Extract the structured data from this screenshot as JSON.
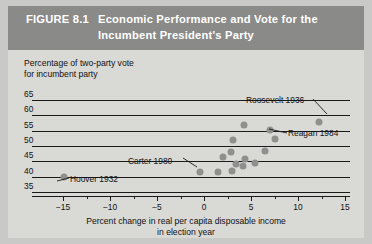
{
  "figure": {
    "number": "FIGURE 8.1",
    "title_line1": "Economic Performance and Vote for the",
    "title_line2": "Incumbent President's Party",
    "banner_color": "#8a8a88",
    "page_background": "#c9c9c7",
    "figure_background": "#d9d9d6"
  },
  "chart_data": {
    "type": "scatter",
    "title": "Economic Performance and Vote for the Incumbent President's Party",
    "xlabel": "Percent change in real per capita disposable income in election year",
    "ylabel": "Percentage of two-party vote for incumbent party",
    "ylabel_line1": "Percentage of two-party vote",
    "ylabel_line2": "for incumbent party",
    "xlabel_line1": "Percent change in real per capita disposable income",
    "xlabel_line2": "in election year",
    "xlim": [
      -15,
      15
    ],
    "ylim": [
      35,
      65
    ],
    "xticks": [
      -15,
      -10,
      -5,
      0,
      5,
      10,
      15
    ],
    "yticks": [
      65,
      60,
      55,
      50,
      45,
      40,
      35
    ],
    "xtick_labels": [
      "−15",
      "−10",
      "−5",
      "0",
      "5",
      "10",
      "15"
    ],
    "ytick_labels": [
      "65",
      "60",
      "55",
      "50",
      "45",
      "40",
      "35"
    ],
    "xtick_minor": [
      -12.5,
      -7.5,
      -2.5,
      2.5,
      7.5,
      12.5
    ],
    "grid": "horizontal",
    "legend": "none",
    "point_color": "#8f8f8d",
    "points": [
      {
        "x": -14.9,
        "y": 39.8,
        "label": "Hoover 1932"
      },
      {
        "x": -0.4,
        "y": 41.4,
        "label": "Carter 1980"
      },
      {
        "x": 1.5,
        "y": 41.6,
        "label": ""
      },
      {
        "x": 3.0,
        "y": 41.9,
        "label": ""
      },
      {
        "x": 3.4,
        "y": 44.2,
        "label": ""
      },
      {
        "x": 4.1,
        "y": 43.6,
        "label": ""
      },
      {
        "x": 2.0,
        "y": 46.3,
        "label": ""
      },
      {
        "x": 2.9,
        "y": 48.1,
        "label": ""
      },
      {
        "x": 4.4,
        "y": 45.9,
        "label": ""
      },
      {
        "x": 5.4,
        "y": 44.5,
        "label": ""
      },
      {
        "x": 6.5,
        "y": 48.3,
        "label": ""
      },
      {
        "x": 3.1,
        "y": 52.0,
        "label": ""
      },
      {
        "x": 7.5,
        "y": 52.4,
        "label": "Reagan 1984"
      },
      {
        "x": 4.3,
        "y": 57.0,
        "label": ""
      },
      {
        "x": 7.0,
        "y": 55.2,
        "label": ""
      },
      {
        "x": 12.2,
        "y": 57.8,
        "label": "Roosevelt 1936"
      }
    ],
    "annotations": [
      {
        "text": "Roosevelt 1936",
        "text_x": 238,
        "text_y": 89,
        "line_x1": 304,
        "line_y1": 92,
        "line_x2": 318,
        "line_y2": 107
      },
      {
        "text": "Reagan 1984",
        "text_x": 280,
        "text_y": 122,
        "line_x1": 278,
        "line_y1": 126,
        "line_x2": 260,
        "line_y2": 122
      },
      {
        "text": "Carter 1980",
        "text_x": 120,
        "text_y": 150,
        "line_x1": 174,
        "line_y1": 151,
        "line_x2": 188,
        "line_y2": 160
      },
      {
        "text": "Hoover 1932",
        "text_x": 62,
        "text_y": 168,
        "line_x1": 60,
        "line_y1": 171,
        "line_x2": 48,
        "line_y2": 174
      }
    ]
  }
}
